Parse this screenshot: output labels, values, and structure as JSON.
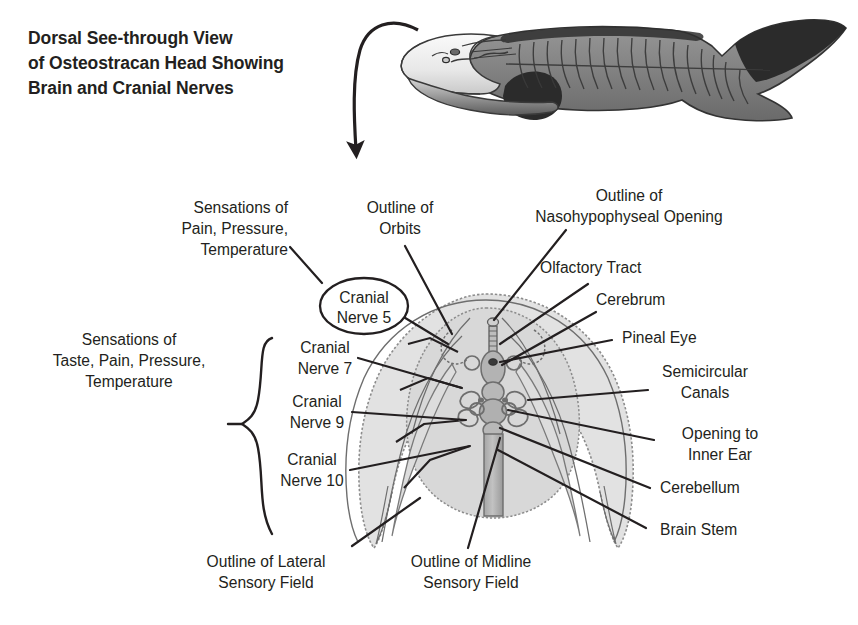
{
  "title": {
    "line1": "Dorsal See-through View",
    "line2": "of Osteostracan Head Showing",
    "line3": "Brain and Cranial Nerves",
    "full": "Dorsal See-through View of Osteostracan Head Showing Brain and Cranial Nerves"
  },
  "specimen": {
    "name": "osteostracan-fish-lateral-view",
    "description": "Whole osteostracan fish shown in dorso-lateral view with bony head shield, segmented trunk and heterocercal tail"
  },
  "pointer": {
    "name": "curved-arrow",
    "description": "Curved arrow from fish head down to enlarged head diagram"
  },
  "labels": {
    "left": [
      {
        "id": "sensations-pain-pressure-temperature",
        "text": "Sensations of\nPain, Pressure,\nTemperature",
        "align": "right"
      },
      {
        "id": "sensations-taste-pain-pressure-temperature",
        "text": "Sensations of\nTaste, Pain, Pressure,\nTemperature",
        "align": "center"
      },
      {
        "id": "cranial-nerve-7",
        "text": "Cranial\nNerve 7",
        "align": "center"
      },
      {
        "id": "cranial-nerve-9",
        "text": "Cranial\nNerve 9",
        "align": "center"
      },
      {
        "id": "cranial-nerve-10",
        "text": "Cranial\nNerve 10",
        "align": "center"
      }
    ],
    "callout": {
      "id": "cranial-nerve-5",
      "text": "Cranial\nNerve 5"
    },
    "top": [
      {
        "id": "outline-of-orbits",
        "text": "Outline of\nOrbits",
        "align": "center"
      },
      {
        "id": "outline-of-nasohypophyseal-opening",
        "text": "Outline of\nNasohypophyseal Opening",
        "align": "center"
      }
    ],
    "right": [
      {
        "id": "olfactory-tract",
        "text": "Olfactory Tract",
        "align": "left"
      },
      {
        "id": "cerebrum",
        "text": "Cerebrum",
        "align": "left"
      },
      {
        "id": "pineal-eye",
        "text": "Pineal Eye",
        "align": "left"
      },
      {
        "id": "semicircular-canals",
        "text": "Semicircular\nCanals",
        "align": "center"
      },
      {
        "id": "opening-to-inner-ear",
        "text": "Opening to\nInner Ear",
        "align": "center"
      },
      {
        "id": "cerebellum",
        "text": "Cerebellum",
        "align": "left"
      },
      {
        "id": "brain-stem",
        "text": "Brain Stem",
        "align": "left"
      }
    ],
    "bottom": [
      {
        "id": "outline-of-lateral-sensory-field",
        "text": "Outline of Lateral\nSensory Field",
        "align": "center"
      },
      {
        "id": "outline-of-midline-sensory-field",
        "text": "Outline of Midline\nSensory Field",
        "align": "center"
      }
    ]
  },
  "colors": {
    "ink": "#231f20",
    "shield_fill": "#e2e2e2",
    "shield_stroke": "#8c8c8c",
    "inner_field_fill": "#d8d8d8",
    "brain_fill": "#b3b3b3",
    "brain_stroke": "#6e6e6e",
    "fish_body": "#808080",
    "fish_dark": "#2b2b2b",
    "fish_pale": "#f2f2f2",
    "background": "#ffffff"
  }
}
